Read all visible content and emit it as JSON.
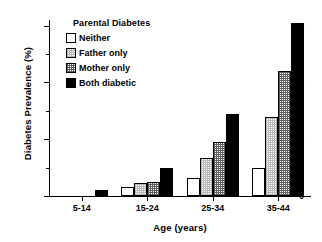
{
  "chart_data": {
    "type": "bar",
    "title": "",
    "xlabel": "Age (years)",
    "ylabel": "Diabetes Prevalence (%)",
    "categories": [
      "5-14",
      "15-24",
      "25-34",
      "35-44"
    ],
    "series": [
      {
        "name": "Neither",
        "values": [
          0,
          3,
          6.5,
          10
        ]
      },
      {
        "name": "Father only",
        "values": [
          0,
          4.5,
          13.5,
          28
        ]
      },
      {
        "name": "Mother only",
        "values": [
          0,
          4.8,
          19,
          44
        ]
      },
      {
        "name": "Both diabetic",
        "values": [
          2,
          10,
          29,
          61
        ]
      }
    ],
    "ylim": [
      0,
      62
    ],
    "yticks": [
      0,
      20,
      40,
      60
    ],
    "ytick_labels": [
      "0",
      "20",
      "40",
      "60"
    ],
    "yminor_ticks": [
      10,
      30,
      50
    ],
    "grid": false,
    "legend": {
      "title": "Parental Diabetes",
      "position": "upper-left-inside",
      "entries": [
        {
          "label": "Neither",
          "fill": "white"
        },
        {
          "label": "Father only",
          "fill": "light-hatch"
        },
        {
          "label": "Mother only",
          "fill": "dark-hatch"
        },
        {
          "label": "Both diabetic",
          "fill": "black"
        }
      ]
    }
  }
}
